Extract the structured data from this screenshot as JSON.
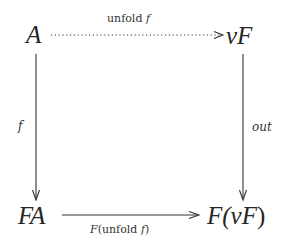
{
  "diagram": {
    "type": "commutative-square",
    "nodes": {
      "top_left": "A",
      "top_right": "νF",
      "bottom_left": "FA",
      "bottom_right_prefix": "F(",
      "bottom_right_inner": "νF",
      "bottom_right_suffix": ")",
      "bottom_right": "F(νF)"
    },
    "arrows": {
      "top": {
        "label_word": "unfold",
        "label_var": "f",
        "label": "unfold f",
        "style": "dotted",
        "from": "A",
        "to": "νF"
      },
      "left": {
        "label": "f",
        "style": "solid",
        "from": "A",
        "to": "FA"
      },
      "right": {
        "label": "out",
        "style": "solid",
        "from": "νF",
        "to": "F(νF)"
      },
      "bottom": {
        "label_prefix": "F",
        "label_open": "(",
        "label_word": "unfold",
        "label_var": "f",
        "label_close": ")",
        "label": "F(unfold f)",
        "style": "solid",
        "from": "FA",
        "to": "F(νF)"
      }
    },
    "colors": {
      "ink": "#262626",
      "background": "#ffffff"
    }
  }
}
